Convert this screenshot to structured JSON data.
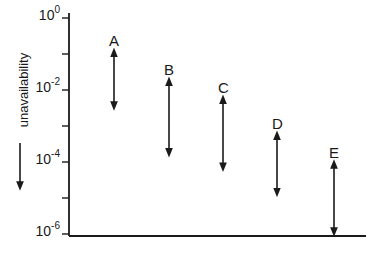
{
  "chart_data": {
    "type": "range",
    "title": "",
    "xlabel": "",
    "ylabel": "unavailability",
    "ylabel_arrow": "down",
    "yscale": "log",
    "ylim": [
      1e-06,
      1
    ],
    "y_ticks": [
      {
        "exp": 0,
        "label_base": "10",
        "label_exp": "0"
      },
      {
        "exp": -1,
        "label_base": "",
        "label_exp": ""
      },
      {
        "exp": -2,
        "label_base": "10",
        "label_exp": "-2"
      },
      {
        "exp": -3,
        "label_base": "",
        "label_exp": ""
      },
      {
        "exp": -4,
        "label_base": "10",
        "label_exp": "-4"
      },
      {
        "exp": -5,
        "label_base": "",
        "label_exp": ""
      },
      {
        "exp": -6,
        "label_base": "10",
        "label_exp": "-6"
      }
    ],
    "categories": [
      "A",
      "B",
      "C",
      "D",
      "E"
    ],
    "series": [
      {
        "name": "unavailability range",
        "upper_exp": [
          -0.9,
          -1.7,
          -2.2,
          -3.2,
          -4.0
        ],
        "lower_exp": [
          -2.5,
          -3.8,
          -4.2,
          -4.9,
          -6.0
        ],
        "upper": [
          0.126,
          0.02,
          0.0063,
          0.00063,
          0.0001
        ],
        "lower": [
          0.0032,
          0.00016,
          6.3e-05,
          1.26e-05,
          1e-06
        ]
      }
    ],
    "grid": false,
    "legend": false
  }
}
